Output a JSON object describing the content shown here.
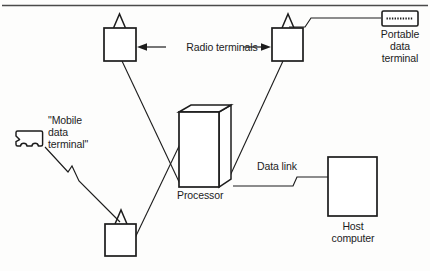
{
  "figure": {
    "type": "network-topology-diagram",
    "title": "",
    "background_color": "#fdfdfc",
    "stroke_color": "#1c1c1c",
    "top_rule": {
      "name": "top-horizontal-rule",
      "color": "#3a3a3a"
    }
  },
  "labels": {
    "radio_terminals": "Radio terminals",
    "portable_data_terminal": "Portable\ndata\nterminal",
    "mobile_data_terminal": "\"Mobile\ndata\nterminal\"",
    "processor": "Processor",
    "data_link": "Data link",
    "host_computer": "Host\ncomputer"
  },
  "nodes": [
    {
      "id": "radio-terminal-top-left",
      "label": "",
      "icon": "radio-terminal-icon",
      "shape": "square-with-antenna",
      "x": 104,
      "y": 28,
      "w": 32,
      "h": 33
    },
    {
      "id": "radio-terminal-top-right",
      "label": "",
      "icon": "radio-terminal-icon",
      "shape": "square-with-antenna",
      "x": 272,
      "y": 28,
      "w": 31,
      "h": 33
    },
    {
      "id": "radio-terminal-bottom",
      "label": "",
      "icon": "radio-terminal-icon",
      "shape": "square-with-antenna",
      "x": 105,
      "y": 224,
      "w": 31,
      "h": 32
    },
    {
      "id": "processor",
      "label": "Processor",
      "icon": "processor-3d-box-icon",
      "shape": "isometric-cuboid",
      "x": 179,
      "y": 112,
      "w": 52,
      "h": 75
    },
    {
      "id": "host-computer",
      "label": "Host\ncomputer",
      "icon": "host-computer-icon",
      "shape": "rectangle",
      "x": 328,
      "y": 157,
      "w": 49,
      "h": 59
    },
    {
      "id": "portable-data-terminal",
      "label": "Portable\ndata\nterminal",
      "icon": "portable-data-terminal-icon",
      "shape": "small-rectangle-with-display",
      "x": 382,
      "y": 12,
      "w": 36,
      "h": 14
    },
    {
      "id": "mobile-data-terminal",
      "label": "\"Mobile\ndata\nterminal\"",
      "icon": "vehicle-icon",
      "shape": "truck-silhouette",
      "x": 14,
      "y": 130,
      "w": 31,
      "h": 20
    }
  ],
  "links": [
    {
      "id": "link-top-left-rt-to-processor",
      "from": "radio-terminal-top-left",
      "to": "processor",
      "style": "solid"
    },
    {
      "id": "link-top-right-rt-to-processor",
      "from": "radio-terminal-top-right",
      "to": "processor",
      "style": "solid"
    },
    {
      "id": "link-bottom-rt-to-processor",
      "from": "radio-terminal-bottom",
      "to": "processor",
      "style": "solid"
    },
    {
      "id": "link-mobile-terminal-radio",
      "from": "mobile-data-terminal",
      "to": "radio-terminal-bottom",
      "style": "radio-zigzag",
      "label": ""
    },
    {
      "id": "link-portable-terminal-radio",
      "from": "portable-data-terminal",
      "to": "radio-terminal-top-right",
      "style": "radio-zigzag",
      "label": ""
    },
    {
      "id": "link-processor-host",
      "from": "processor",
      "to": "host-computer",
      "style": "radio-zigzag",
      "label": "Data link"
    }
  ],
  "annotations": [
    {
      "id": "radio-terminals-callout",
      "text": "Radio terminals",
      "arrow": "double-headed",
      "points_to": [
        "radio-terminal-top-left",
        "radio-terminal-top-right"
      ]
    }
  ]
}
